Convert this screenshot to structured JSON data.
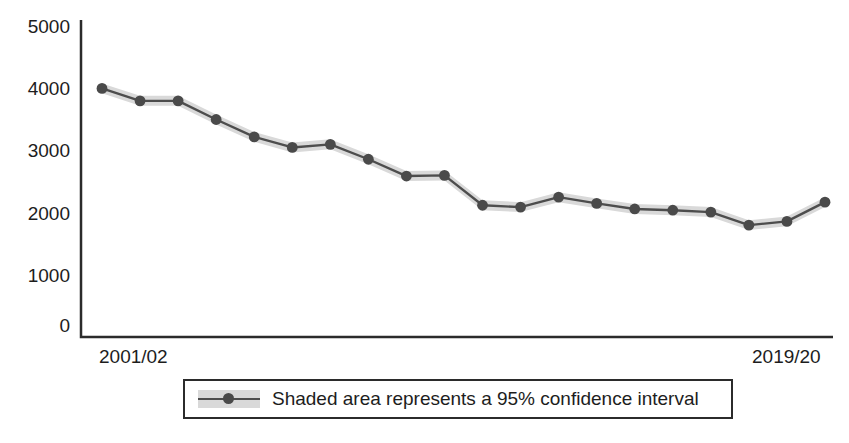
{
  "chart_data": {
    "type": "line",
    "title": "",
    "subtitle": "",
    "xlabel": "",
    "ylabel": "",
    "grid": false,
    "legend_position": "bottom",
    "ylim": [
      0,
      5000
    ],
    "y_ticks": [
      "0",
      "1000",
      "2000",
      "3000",
      "4000",
      "5000"
    ],
    "y_tick_values": [
      0,
      1000,
      2000,
      3000,
      4000,
      5000
    ],
    "x_ticks": [
      "2001/02",
      "2019/20"
    ],
    "categories": [
      "2001/02",
      "2002/03",
      "2003/04",
      "2004/05",
      "2005/06",
      "2006/07",
      "2007/08",
      "2008/09",
      "2009/10",
      "2010/11",
      "2011/12",
      "2012/13",
      "2013/14",
      "2014/15",
      "2015/16",
      "2016/17",
      "2017/18",
      "2018/19",
      "2019/20",
      "2020/21"
    ],
    "series": [
      {
        "name": "Shaded area represents a 95% confidence interval",
        "values": [
          4000,
          3800,
          3800,
          3500,
          3220,
          3050,
          3100,
          2860,
          2590,
          2600,
          2120,
          2090,
          2250,
          2150,
          2060,
          2040,
          2010,
          1800,
          1860,
          2170
        ],
        "ci_lower": [
          3920,
          3720,
          3720,
          3420,
          3140,
          2970,
          3020,
          2780,
          2510,
          2520,
          2040,
          2010,
          2170,
          2070,
          1980,
          1960,
          1930,
          1720,
          1780,
          2090
        ],
        "ci_upper": [
          4080,
          3880,
          3880,
          3580,
          3300,
          3130,
          3180,
          2940,
          2670,
          2680,
          2200,
          2170,
          2330,
          2230,
          2140,
          2120,
          2090,
          1880,
          1940,
          2250
        ],
        "line_color": "#4d4d4d",
        "marker_color": "#4a4a4a",
        "band_color": "#d9d9d9"
      }
    ],
    "annotations": []
  },
  "axes": {
    "axis_color": "#2b2b2b",
    "x_label_left": "2001/02",
    "x_label_right": "2019/20"
  },
  "legend": {
    "label": "Shaded area represents a 95% confidence interval",
    "border_color": "#2b2b2b",
    "swatch_color": "#d9d9d9",
    "line_color": "#4d4d4d",
    "marker_color": "#4a4a4a"
  }
}
